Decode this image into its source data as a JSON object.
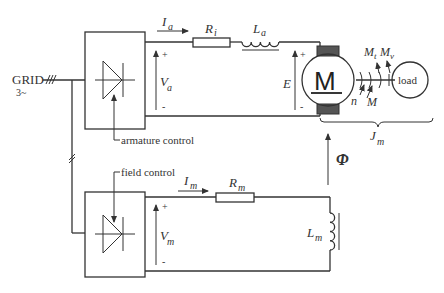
{
  "diagram": {
    "type": "DC motor drive schematic with armature and field converters",
    "grid": {
      "label": "GRID",
      "phase_label": "3~",
      "phases_mark": "///"
    },
    "armature_circuit": {
      "converter_label": "armature control",
      "current": {
        "symbol": "I",
        "sub": "a"
      },
      "resistor": {
        "symbol": "R",
        "sub": "i"
      },
      "inductor": {
        "symbol": "L",
        "sub": "a"
      },
      "voltage": {
        "symbol": "V",
        "sub": "a",
        "plus": "+",
        "minus": "-"
      },
      "emf": {
        "symbol": "E",
        "plus": "+",
        "minus": "-"
      }
    },
    "motor": {
      "label": "M",
      "speed": "n",
      "torque": "M",
      "torque_loss": {
        "symbol": "M",
        "sub": "t"
      },
      "torque_friction": {
        "symbol": "M",
        "sub": "v"
      },
      "load_label": "load",
      "inertia": {
        "symbol": "J",
        "sub": "m"
      }
    },
    "flux": {
      "symbol": "Φ"
    },
    "field_circuit": {
      "converter_label": "field control",
      "current": {
        "symbol": "I",
        "sub": "m"
      },
      "resistor": {
        "symbol": "R",
        "sub": "m"
      },
      "inductor": {
        "symbol": "L",
        "sub": "m"
      },
      "voltage": {
        "symbol": "V",
        "sub": "m",
        "plus": "+",
        "minus": "-"
      }
    }
  }
}
